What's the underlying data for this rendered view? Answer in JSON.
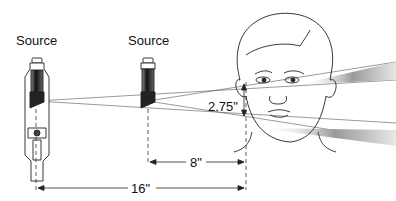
{
  "labels": {
    "source_left": "Source",
    "source_middle": "Source",
    "height_offset": "2.75\"",
    "distance_short": "8\"",
    "distance_long": "16\""
  },
  "colors": {
    "line": "#222222",
    "beam_light": "#e6e6e6",
    "beam_dark": "#9a9a9a",
    "tube_dark": "#1a1a1a"
  }
}
